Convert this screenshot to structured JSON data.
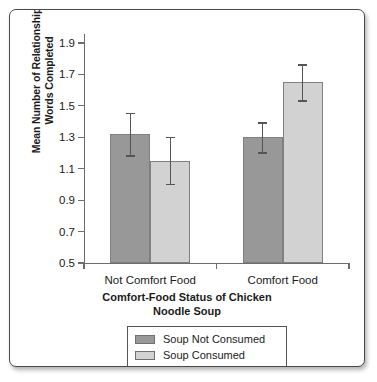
{
  "chart_data": {
    "type": "bar",
    "title": "",
    "xlabel": "Comfort-Food Status of Chicken Noodle Soup",
    "xlabel_line1": "Comfort-Food Status of Chicken",
    "xlabel_line2": "Noodle Soup",
    "ylabel": "Mean Number of Relationship Words Completed",
    "ylabel_line1": "Mean Number of Relationship",
    "ylabel_line2": "Words Completed",
    "ylim": [
      0.5,
      1.9
    ],
    "yticks": [
      "1.9",
      "1.7",
      "1.5",
      "1.3",
      "1.1",
      "0.9",
      "0.7",
      "0.5"
    ],
    "ytick_values": [
      1.9,
      1.7,
      1.5,
      1.3,
      1.1,
      0.9,
      0.7,
      0.5
    ],
    "categories": [
      "Not Comfort Food",
      "Comfort Food"
    ],
    "grid": false,
    "legend_position": "bottom",
    "series": [
      {
        "name": "Soup Not Consumed",
        "color": "#989898",
        "values": [
          1.32,
          1.3
        ],
        "error_low": [
          1.18,
          1.2
        ],
        "error_high": [
          1.45,
          1.39
        ]
      },
      {
        "name": "Soup Consumed",
        "color": "#d2d2d2",
        "values": [
          1.15,
          1.65
        ],
        "error_low": [
          1.0,
          1.53
        ],
        "error_high": [
          1.3,
          1.76
        ]
      }
    ]
  },
  "legend": {
    "entries": [
      {
        "label": "Soup Not Consumed",
        "swatch": "dark"
      },
      {
        "label": "Soup Consumed",
        "swatch": "light"
      }
    ]
  }
}
